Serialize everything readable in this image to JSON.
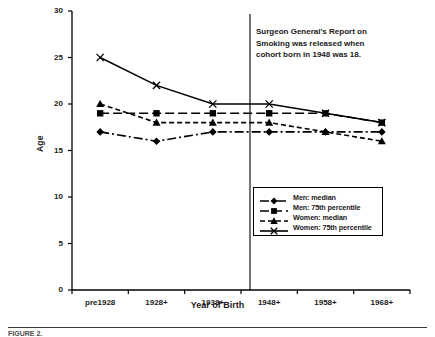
{
  "chart_data": {
    "type": "line",
    "title": "",
    "xlabel": "Year of Birth",
    "ylabel": "Age",
    "categories": [
      "pre1928",
      "1928+",
      "1938+",
      "1948+",
      "1958+",
      "1968+"
    ],
    "ylim": [
      0,
      30
    ],
    "yticks": [
      0,
      5,
      10,
      15,
      20,
      25,
      30
    ],
    "grid": false,
    "legend_position": "lower-right",
    "series": [
      {
        "name": "Men: median",
        "marker": "diamond",
        "dash": "dashdot",
        "values": [
          17,
          16,
          17,
          17,
          17,
          17
        ]
      },
      {
        "name": "Men: 75th percentile",
        "marker": "square",
        "dash": "longdash",
        "values": [
          19,
          19,
          19,
          19,
          19,
          18
        ]
      },
      {
        "name": "Women: median",
        "marker": "triangle",
        "dash": "shortdash",
        "values": [
          20,
          18,
          18,
          18,
          17,
          16
        ]
      },
      {
        "name": "Women: 75th percentile",
        "marker": "cross",
        "dash": "solid",
        "values": [
          25,
          22,
          20,
          20,
          19,
          18
        ]
      }
    ],
    "annotations": [
      {
        "name": "surgeon-general-note",
        "text": "Surgeon General's Report on Smoking  was released when cohort born in 1948 was 18.",
        "reference_line": {
          "orientation": "vertical",
          "between": [
            "1938+",
            "1948+"
          ]
        }
      }
    ]
  },
  "caption": {
    "text": "FIGURE 2."
  }
}
